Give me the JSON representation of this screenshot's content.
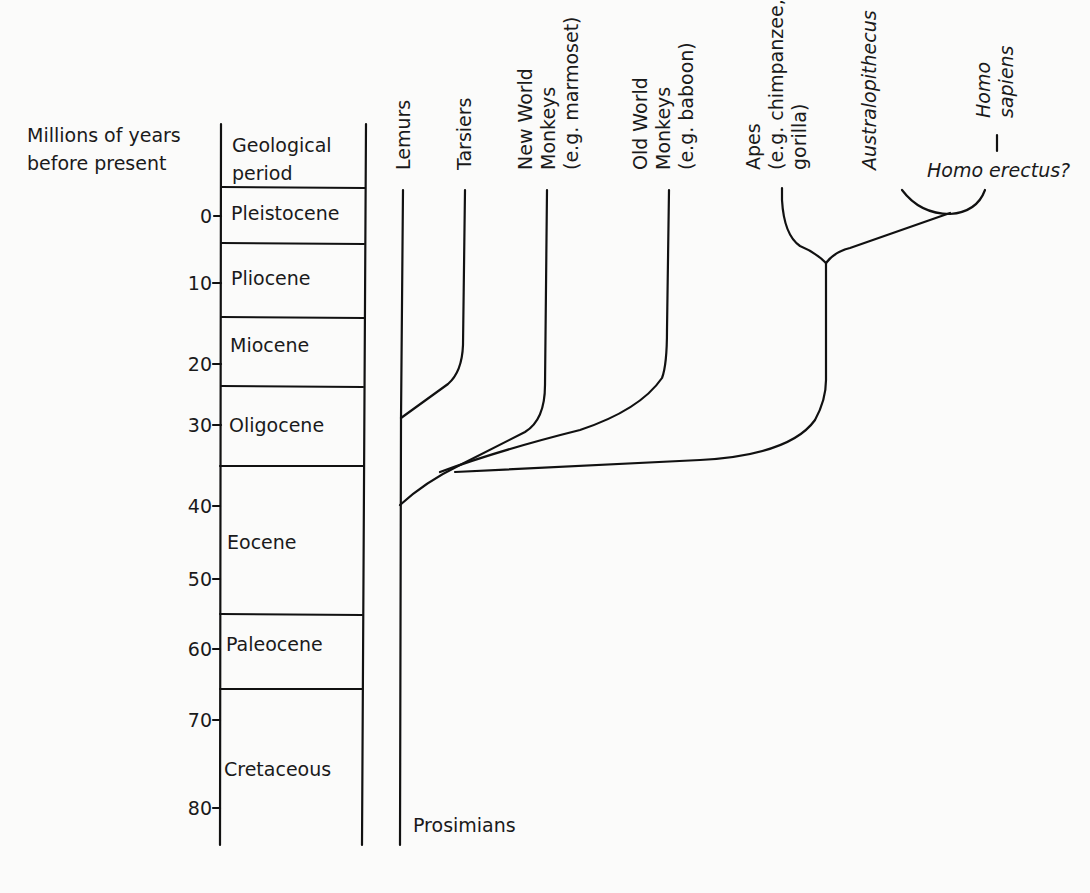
{
  "diagram": {
    "type": "phylogenetic-tree-with-geological-timescale",
    "axis": {
      "title_line1": "Millions of years",
      "title_line2": "before present",
      "ticks": [
        {
          "label": "0",
          "y": 216
        },
        {
          "label": "10",
          "y": 283
        },
        {
          "label": "20",
          "y": 364
        },
        {
          "label": "30",
          "y": 425
        },
        {
          "label": "40",
          "y": 506
        },
        {
          "label": "50",
          "y": 579
        },
        {
          "label": "60",
          "y": 649
        },
        {
          "label": "70",
          "y": 720
        },
        {
          "label": "80",
          "y": 808
        }
      ]
    },
    "period_column": {
      "header_line1": "Geological",
      "header_line2": "period",
      "periods": [
        {
          "name": "Pleistocene",
          "top": 187,
          "bottom": 243,
          "label_y": 220
        },
        {
          "name": "Pliocene",
          "top": 243,
          "bottom": 317,
          "label_y": 278
        },
        {
          "name": "Miocene",
          "top": 317,
          "bottom": 386,
          "label_y": 351
        },
        {
          "name": "Oligocene",
          "top": 386,
          "bottom": 466,
          "label_y": 431
        },
        {
          "name": "Eocene",
          "top": 466,
          "bottom": 614,
          "label_y": 549
        },
        {
          "name": "Paleocene",
          "top": 614,
          "bottom": 689,
          "label_y": 650
        },
        {
          "name": "Cretaceous",
          "top": 689,
          "bottom": 845,
          "label_y": 776
        }
      ]
    },
    "taxa": [
      {
        "id": "lemurs",
        "lines": [
          "Lemurs"
        ],
        "italic": false
      },
      {
        "id": "tarsiers",
        "lines": [
          "Tarsiers"
        ],
        "italic": false
      },
      {
        "id": "new-world-monkeys",
        "lines": [
          "New World",
          "Monkeys",
          "(e.g. marmoset)"
        ],
        "italic": false
      },
      {
        "id": "old-world-monkeys",
        "lines": [
          "Old World",
          "Monkeys",
          "(e.g. baboon)"
        ],
        "italic": false
      },
      {
        "id": "apes",
        "lines": [
          "Apes",
          "(e.g. chimpanzee,",
          "gorilla)"
        ],
        "italic": false
      },
      {
        "id": "australopithecus",
        "lines": [
          "Australopithecus"
        ],
        "italic": true
      },
      {
        "id": "homo-sapiens",
        "lines": [
          "Homo",
          "sapiens"
        ],
        "italic": true
      }
    ],
    "homo_erectus_label": "Homo erectus?",
    "prosimians_label": "Prosimians"
  }
}
